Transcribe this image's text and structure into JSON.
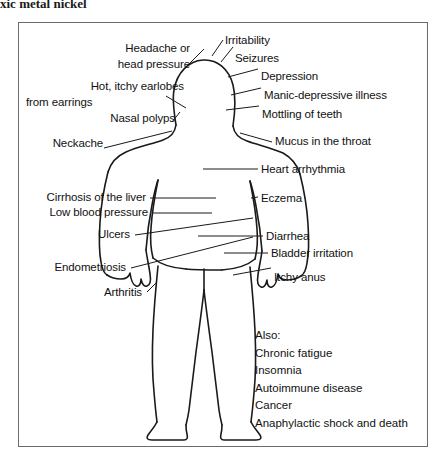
{
  "page": {
    "heading_partial": "xic metal nickel"
  },
  "figure": {
    "frame_color": "#6b6b6b",
    "line_color": "#1a1a1a",
    "background": "#ffffff"
  },
  "labels_left": [
    {
      "id": "headache",
      "lines": [
        "Headache or",
        "head pressure"
      ]
    },
    {
      "id": "earlobes",
      "lines": [
        "Hot, itchy earlobes",
        "from earrings"
      ]
    },
    {
      "id": "nasal-polyps",
      "lines": [
        "Nasal polyps"
      ]
    },
    {
      "id": "neckache",
      "lines": [
        "Neckache"
      ]
    },
    {
      "id": "cirrhosis",
      "lines": [
        "Cirrhosis of the liver"
      ]
    },
    {
      "id": "low-blood-pressure",
      "lines": [
        "Low blood pressure"
      ]
    },
    {
      "id": "ulcers",
      "lines": [
        "Ulcers"
      ]
    },
    {
      "id": "endometriosis",
      "lines": [
        "Endometriosis"
      ]
    },
    {
      "id": "arthritis",
      "lines": [
        "Arthritis"
      ]
    }
  ],
  "labels_right": [
    {
      "id": "irritability",
      "lines": [
        "Irritability"
      ]
    },
    {
      "id": "seizures",
      "lines": [
        "Seizures"
      ]
    },
    {
      "id": "depression",
      "lines": [
        "Depression"
      ]
    },
    {
      "id": "manic-depressive",
      "lines": [
        "Manic-depressive illness"
      ]
    },
    {
      "id": "mottling-teeth",
      "lines": [
        "Mottling of teeth"
      ]
    },
    {
      "id": "mucus-throat",
      "lines": [
        "Mucus in the throat"
      ]
    },
    {
      "id": "heart-arrhythmia",
      "lines": [
        "Heart arrhythmia"
      ]
    },
    {
      "id": "eczema",
      "lines": [
        "Eczema"
      ]
    },
    {
      "id": "diarrhea",
      "lines": [
        "Diarrhea"
      ]
    },
    {
      "id": "bladder-irritation",
      "lines": [
        "Bladder irritation"
      ]
    },
    {
      "id": "itchy-anus",
      "lines": [
        "Itchy anus"
      ]
    }
  ],
  "also": {
    "heading": "Also:",
    "items": [
      "Chronic fatigue",
      "Insomnia",
      "Autoimmune disease",
      "Cancer",
      "Anaphylactic shock and death"
    ]
  }
}
